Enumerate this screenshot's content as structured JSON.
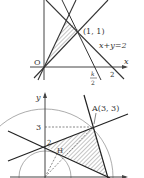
{
  "figure1": {
    "axis_x": "x",
    "point_label": "(1, 1)",
    "line_label": "x+y=2",
    "origin": "O",
    "tick_2": "2",
    "k_num": "k",
    "k_den": "2"
  },
  "figure2": {
    "axis_y": "y",
    "point_label": "A(3, 3)",
    "tick_3": "3",
    "tick_2": "2",
    "foot_label": "H"
  },
  "colors": {
    "line": "#333333",
    "hatch": "#555555",
    "axis": "#444444",
    "circle": "#777777"
  }
}
